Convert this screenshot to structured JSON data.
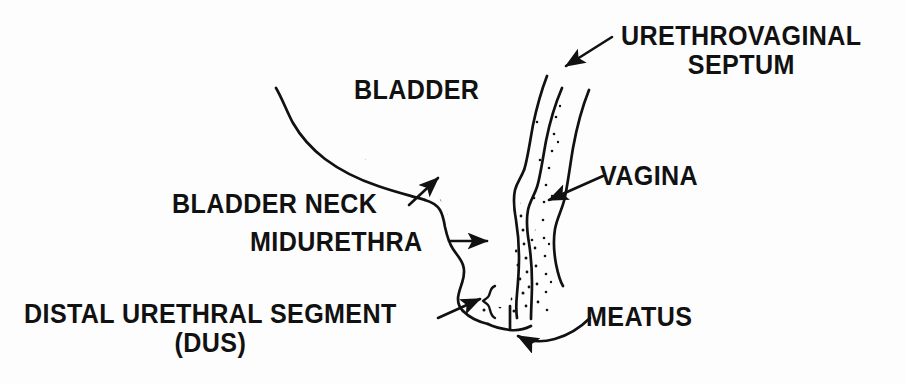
{
  "figure": {
    "background_color": "#fdfdfd",
    "ink_color": "#111111"
  },
  "labels": {
    "urethrovaginal_septum": {
      "line1": "URETHROVAGINAL",
      "line2": "SEPTUM"
    },
    "bladder": "BLADDER",
    "vagina": "VAGINA",
    "bladder_neck": "BLADDER NECK",
    "midurethra": "MIDURETHRA",
    "distal_urethral_segment": {
      "line1": "DISTAL URETHRAL SEGMENT",
      "line2": "(DUS)"
    },
    "meatus": "MEATUS"
  },
  "structures": [
    {
      "name": "bladder",
      "description": "stippled bladder body with smooth superior-posterior outline"
    },
    {
      "name": "bladder-neck",
      "description": "junction of bladder base and proximal urethra"
    },
    {
      "name": "midurethra",
      "description": "middle third of the urethral tube"
    },
    {
      "name": "distal-urethral-segment",
      "description": "distal urethral segment marked by a curly brace"
    },
    {
      "name": "meatus",
      "description": "external urethral opening at the inferior end"
    },
    {
      "name": "urethrovaginal-septum",
      "description": "tissue plane separating urethra from vagina"
    },
    {
      "name": "vagina",
      "description": "stippled vaginal canal posterior to the urethra"
    }
  ],
  "leaders": [
    {
      "name": "urethrovaginal-septum-leader",
      "style": "straight-arrow",
      "direction": "down-left"
    },
    {
      "name": "vagina-leader",
      "style": "straight-arrow",
      "direction": "down-left"
    },
    {
      "name": "bladder-neck-leader",
      "style": "straight-arrow",
      "direction": "up-right"
    },
    {
      "name": "midurethra-leader",
      "style": "straight-arrow",
      "direction": "right"
    },
    {
      "name": "distal-urethral-segment-leader",
      "style": "straight-arrow-to-brace",
      "direction": "up-right"
    },
    {
      "name": "meatus-leader",
      "style": "curved-arrow",
      "direction": "up-left"
    }
  ]
}
